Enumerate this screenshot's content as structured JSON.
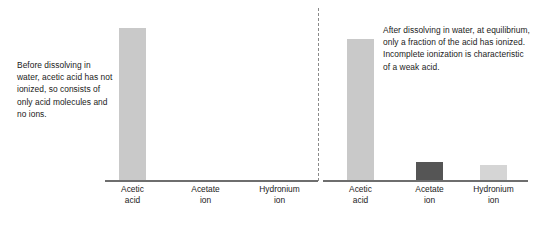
{
  "figure": {
    "width": 535,
    "height": 225,
    "background": "#ffffff"
  },
  "annotations": {
    "before": "Before dissolving in water, acetic acid has not ionized, so consists of only acid molecules and no ions.",
    "after": "After dissolving in water, at equilibrium, only a fraction of the acid has ionized. Incomplete ionization is characteristic of a weak acid."
  },
  "colors": {
    "acid_light_gray": "#c9c9c9",
    "acetate_dark_gray": "#555555",
    "hydronium_pale_gray": "#d5d5d5",
    "axis_gray": "#6e6e6e",
    "divider_gray": "#8a8a8a",
    "text": "#1a1a1a"
  },
  "chart_data": {
    "type": "bar",
    "title": "",
    "xlabel": "",
    "ylabel": "",
    "ylim": [
      0,
      1.0
    ],
    "grid": false,
    "legend": "none",
    "panels": [
      {
        "name": "before-dissolving",
        "annotation": "Before dissolving in water, acetic acid has not ionized, so consists of only acid molecules and no ions.",
        "categories": [
          "Acetic acid",
          "Acetate ion",
          "Hydronium ion"
        ],
        "category_lines": [
          [
            "Acetic",
            "acid"
          ],
          [
            "Acetate",
            "ion"
          ],
          [
            "Hydronium",
            "ion"
          ]
        ],
        "values": [
          0.94,
          0.0,
          0.0
        ],
        "bar_colors": [
          "#c9c9c9",
          "#555555",
          "#d5d5d5"
        ]
      },
      {
        "name": "after-dissolving",
        "annotation": "After dissolving in water, at equilibrium, only a fraction of the acid has ionized. Incomplete ionization is characteristic of a weak acid.",
        "categories": [
          "Acetic acid",
          "Acetate ion",
          "Hydronium ion"
        ],
        "category_lines": [
          [
            "Acetic",
            "acid"
          ],
          [
            "Acetate",
            "ion"
          ],
          [
            "Hydronium",
            "ion"
          ]
        ],
        "values": [
          0.87,
          0.11,
          0.095
        ],
        "bar_colors": [
          "#c9c9c9",
          "#555555",
          "#d5d5d5"
        ]
      }
    ]
  }
}
